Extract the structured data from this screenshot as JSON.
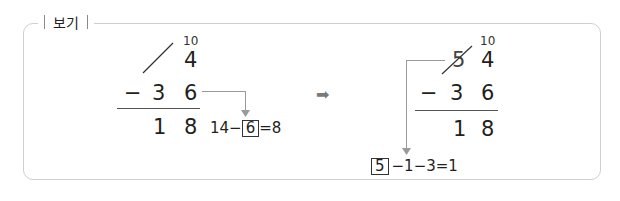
{
  "label": "보기",
  "left": {
    "carry": "10",
    "top_ones": "4",
    "minus": "−",
    "sub_tens": "3",
    "sub_ones": "6",
    "res_tens": "1",
    "res_ones": "8",
    "eq_prefix": "14−",
    "eq_box": "6",
    "eq_suffix": "=8"
  },
  "arrow": "➡",
  "right": {
    "carry": "10",
    "top_tens_struck": "5",
    "top_ones": "4",
    "minus": "−",
    "sub_tens": "3",
    "sub_ones": "6",
    "res_tens": "1",
    "res_ones": "8",
    "eq_box": "5",
    "eq_suffix": "−1−3=1"
  }
}
